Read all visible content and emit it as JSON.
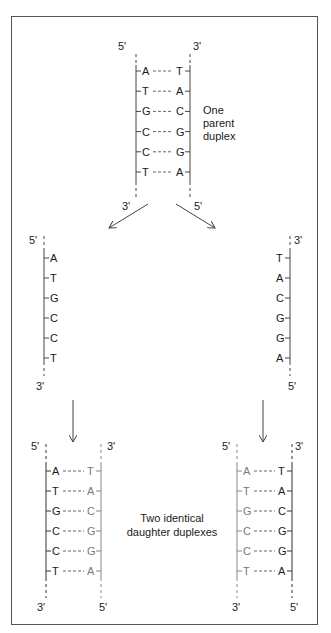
{
  "diagram": {
    "parent": {
      "caption_lines": [
        "One",
        "parent",
        "duplex"
      ],
      "top_labels": {
        "left": "5'",
        "right": "3'"
      },
      "bottom_labels": {
        "left": "3'",
        "right": "5'"
      },
      "pairs": [
        [
          "A",
          "T"
        ],
        [
          "T",
          "A"
        ],
        [
          "G",
          "C"
        ],
        [
          "C",
          "G"
        ],
        [
          "C",
          "G"
        ],
        [
          "T",
          "A"
        ]
      ]
    },
    "separated_left": {
      "top_label": "5'",
      "bottom_label": "3'",
      "bases": [
        "A",
        "T",
        "G",
        "C",
        "C",
        "T"
      ]
    },
    "separated_right": {
      "top_label": "3'",
      "bottom_label": "5'",
      "bases": [
        "T",
        "A",
        "C",
        "G",
        "G",
        "A"
      ]
    },
    "daughter_left": {
      "top_labels": {
        "left": "5'",
        "right": "3'"
      },
      "bottom_labels": {
        "left": "3'",
        "right": "5'"
      },
      "pairs": [
        [
          "A",
          "T"
        ],
        [
          "T",
          "A"
        ],
        [
          "G",
          "C"
        ],
        [
          "C",
          "G"
        ],
        [
          "C",
          "G"
        ],
        [
          "T",
          "A"
        ]
      ],
      "old_strand": "left",
      "new_strand": "right"
    },
    "daughter_right": {
      "top_labels": {
        "left": "5'",
        "right": "3'"
      },
      "bottom_labels": {
        "left": "3'",
        "right": "5'"
      },
      "pairs": [
        [
          "A",
          "T"
        ],
        [
          "T",
          "A"
        ],
        [
          "G",
          "C"
        ],
        [
          "C",
          "G"
        ],
        [
          "C",
          "G"
        ],
        [
          "T",
          "A"
        ]
      ],
      "old_strand": "right",
      "new_strand": "left"
    },
    "daughter_caption_lines": [
      "Two identical",
      "daughter duplexes"
    ],
    "colors": {
      "old_strand": "#1a1a1a",
      "new_strand": "#7a7a7a",
      "border": "#555555"
    }
  }
}
